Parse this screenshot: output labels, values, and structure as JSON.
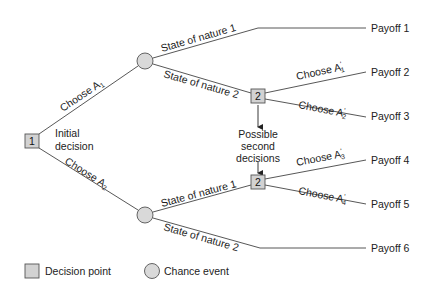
{
  "diagram": {
    "type": "decision-tree",
    "colors": {
      "node_fill": "#d2d2d2",
      "node_stroke": "#555555",
      "edge": "#444444",
      "text": "#222222"
    },
    "nodes": {
      "decision_1": {
        "label": "1",
        "caption_line1": "Initial",
        "caption_line2": "decision"
      },
      "chance_top": {
        "label": ""
      },
      "chance_bottom": {
        "label": ""
      },
      "decision_2_top": {
        "label": "2"
      },
      "decision_2_bottom": {
        "label": "2"
      }
    },
    "edges": {
      "choose_a1": {
        "text": "Choose A",
        "sub": "1",
        "prime": ""
      },
      "choose_a2": {
        "text": "Choose A",
        "sub": "2",
        "prime": ""
      },
      "top_state1": {
        "text": "State of nature 1"
      },
      "top_state2": {
        "text": "State of nature 2"
      },
      "bottom_state1": {
        "text": "State of nature 1"
      },
      "bottom_state2": {
        "text": "State of nature 2"
      },
      "choose_a1p": {
        "text": "Choose A",
        "sub": "1",
        "prime": "'"
      },
      "choose_a2p": {
        "text": "Choose A",
        "sub": "2",
        "prime": "'"
      },
      "choose_a3p": {
        "text": "Choose A",
        "sub": "3",
        "prime": "'"
      },
      "choose_a4p": {
        "text": "Choose A",
        "sub": "4",
        "prime": "'"
      }
    },
    "annotation": {
      "line1": "Possible",
      "line2": "second",
      "line3": "decisions"
    },
    "payoffs": [
      "Payoff 1",
      "Payoff 2",
      "Payoff 3",
      "Payoff 4",
      "Payoff 5",
      "Payoff 6"
    ],
    "legend": {
      "decision_point": "Decision point",
      "chance_event": "Chance event"
    }
  }
}
